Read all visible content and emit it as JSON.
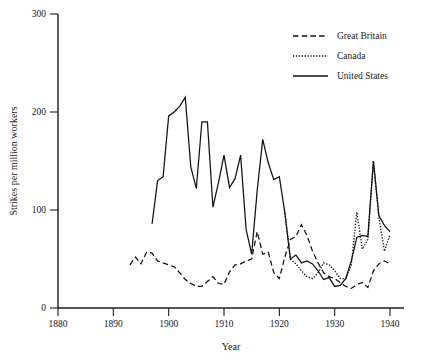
{
  "chart_data": {
    "type": "line",
    "title": "",
    "xlabel": "Year",
    "ylabel": "Strikes per million  workers",
    "xlim": [
      1880,
      1941
    ],
    "ylim": [
      0,
      300
    ],
    "xticks": [
      1880,
      1890,
      1900,
      1910,
      1920,
      1930,
      1940
    ],
    "yticks": [
      0,
      100,
      200,
      300
    ],
    "grid": false,
    "legend_position": "top-right",
    "series": [
      {
        "name": "Great Britain",
        "style": "dashed",
        "x": [
          1893,
          1894,
          1895,
          1896,
          1897,
          1898,
          1899,
          1900,
          1901,
          1902,
          1903,
          1904,
          1905,
          1906,
          1907,
          1908,
          1909,
          1910,
          1911,
          1912,
          1913,
          1914,
          1915,
          1916,
          1917,
          1918,
          1919,
          1920,
          1921,
          1922,
          1923,
          1924,
          1925,
          1926,
          1927,
          1928,
          1929,
          1930,
          1931,
          1932,
          1933,
          1934,
          1935,
          1936,
          1937,
          1938,
          1939,
          1940
        ],
        "values": [
          44,
          52,
          45,
          57,
          56,
          48,
          46,
          44,
          42,
          36,
          29,
          25,
          22,
          22,
          27,
          32,
          25,
          24,
          37,
          44,
          45,
          48,
          50,
          78,
          55,
          57,
          36,
          30,
          52,
          70,
          73,
          85,
          74,
          58,
          46,
          36,
          32,
          30,
          26,
          22,
          20,
          24,
          26,
          21,
          38,
          45,
          48,
          45
        ]
      },
      {
        "name": "Canada",
        "style": "dotted",
        "x": [
          1921,
          1922,
          1923,
          1924,
          1925,
          1926,
          1927,
          1928,
          1929,
          1930,
          1931,
          1932,
          1933,
          1934,
          1935,
          1936,
          1937,
          1938,
          1939,
          1940
        ],
        "values": [
          97,
          50,
          45,
          38,
          32,
          30,
          36,
          46,
          44,
          38,
          30,
          30,
          44,
          98,
          60,
          70,
          150,
          92,
          58,
          75
        ]
      },
      {
        "name": "United States",
        "style": "solid",
        "x": [
          1897,
          1898,
          1899,
          1900,
          1901,
          1902,
          1903,
          1904,
          1905,
          1906,
          1907,
          1908,
          1909,
          1910,
          1911,
          1912,
          1913,
          1914,
          1915,
          1916,
          1917,
          1918,
          1919,
          1920,
          1921,
          1922,
          1923,
          1924,
          1925,
          1926,
          1927,
          1928,
          1929,
          1930,
          1931,
          1932,
          1933,
          1934,
          1935,
          1936,
          1937,
          1938,
          1939,
          1940
        ],
        "values": [
          86,
          130,
          134,
          196,
          200,
          206,
          215,
          144,
          122,
          190,
          190,
          103,
          128,
          156,
          123,
          132,
          156,
          80,
          55,
          120,
          172,
          148,
          131,
          134,
          97,
          50,
          54,
          46,
          48,
          45,
          38,
          29,
          31,
          22,
          23,
          30,
          48,
          72,
          74,
          73,
          150,
          94,
          84,
          78
        ]
      }
    ]
  },
  "legend": {
    "entries": [
      {
        "label": "Great Britain"
      },
      {
        "label": "Canada"
      },
      {
        "label": "United States"
      }
    ]
  },
  "axes": {
    "x_title": "Year",
    "y_title": "Strikes per million  workers",
    "x_tick_labels": [
      "1880",
      "1890",
      "1900",
      "1910",
      "1920",
      "1930",
      "1940"
    ],
    "y_tick_labels": [
      "0",
      "100",
      "200",
      "300"
    ]
  },
  "colors": {
    "ink": "#1a1a1a",
    "background": "#ffffff",
    "series_line": "#111111"
  }
}
